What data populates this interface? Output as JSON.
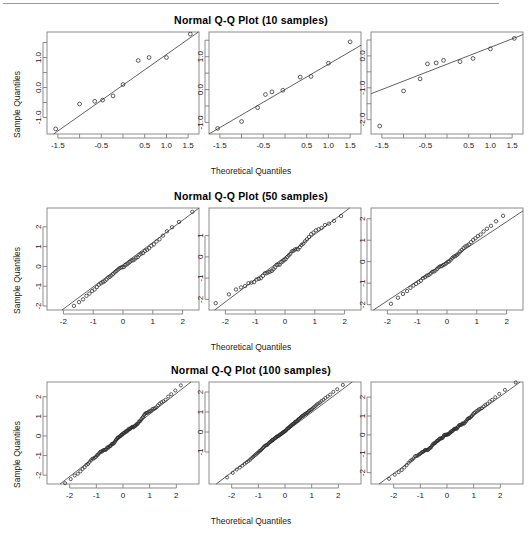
{
  "figure": {
    "axis_label_x": "Theoretical Quantiles",
    "axis_label_y": "Sample Quantiles",
    "rule_color": "#9a9a9a",
    "point_color": "#2b2b2b",
    "line_color": "#3a3a3a",
    "frame_color": "#7f7f7f",
    "background": "#ffffff"
  },
  "rows": [
    {
      "title": "Normal Q-Q Plot (10 samples)",
      "n": 10,
      "xticks": [
        {
          "v": -1.5,
          "label": "-1.5"
        },
        {
          "v": -1.0,
          "label": ""
        },
        {
          "v": -0.5,
          "label": "-0.5"
        },
        {
          "v": 0.0,
          "label": ""
        },
        {
          "v": 0.5,
          "label": "0.5"
        },
        {
          "v": 1.0,
          "label": "1.0"
        },
        {
          "v": 1.5,
          "label": "1.5"
        }
      ],
      "panels": [
        {
          "xlim": [
            -1.75,
            1.75
          ],
          "ylim": [
            -1.55,
            1.85
          ],
          "yticks": [
            {
              "v": -1.0,
              "label": "-1.0"
            },
            {
              "v": -0.5,
              "label": ""
            },
            {
              "v": 0.0,
              "label": "0.0"
            },
            {
              "v": 0.5,
              "label": ""
            },
            {
              "v": 1.0,
              "label": "1.0"
            },
            {
              "v": 1.5,
              "label": ""
            }
          ],
          "qq_line": {
            "slope": 1.02,
            "intercept": 0.08
          },
          "points": [
            {
              "x": -1.55,
              "y": -1.38
            },
            {
              "x": -1.0,
              "y": -0.55
            },
            {
              "x": -0.65,
              "y": -0.46
            },
            {
              "x": -0.47,
              "y": -0.42
            },
            {
              "x": -0.23,
              "y": -0.28
            },
            {
              "x": 0.0,
              "y": 0.1
            },
            {
              "x": 0.35,
              "y": 0.9
            },
            {
              "x": 0.6,
              "y": 1.0
            },
            {
              "x": 1.0,
              "y": 1.0
            },
            {
              "x": 1.55,
              "y": 1.78
            }
          ]
        },
        {
          "xlim": [
            -1.75,
            1.75
          ],
          "ylim": [
            -1.35,
            1.75
          ],
          "yticks": [
            {
              "v": -1.0,
              "label": "-1.0"
            },
            {
              "v": -0.5,
              "label": ""
            },
            {
              "v": 0.0,
              "label": "0.0"
            },
            {
              "v": 0.5,
              "label": ""
            },
            {
              "v": 1.0,
              "label": "1.0"
            },
            {
              "v": 1.5,
              "label": ""
            }
          ],
          "qq_line": {
            "slope": 0.77,
            "intercept": 0.0
          },
          "points": [
            {
              "x": -1.55,
              "y": -1.18
            },
            {
              "x": -1.0,
              "y": -0.97
            },
            {
              "x": -0.63,
              "y": -0.55
            },
            {
              "x": -0.45,
              "y": -0.15
            },
            {
              "x": -0.3,
              "y": -0.07
            },
            {
              "x": -0.05,
              "y": -0.02
            },
            {
              "x": 0.35,
              "y": 0.38
            },
            {
              "x": 0.6,
              "y": 0.4
            },
            {
              "x": 1.0,
              "y": 0.8
            },
            {
              "x": 1.5,
              "y": 1.45
            }
          ]
        },
        {
          "xlim": [
            -1.75,
            1.75
          ],
          "ylim": [
            -2.45,
            0.75
          ],
          "yticks": [
            {
              "v": -2.0,
              "label": "-2.0"
            },
            {
              "v": -1.5,
              "label": ""
            },
            {
              "v": -1.0,
              "label": "-1.0"
            },
            {
              "v": -0.5,
              "label": ""
            },
            {
              "v": 0.0,
              "label": "0.0"
            },
            {
              "v": 0.5,
              "label": ""
            }
          ],
          "qq_line": {
            "slope": 0.53,
            "intercept": -0.26
          },
          "points": [
            {
              "x": -1.55,
              "y": -2.2
            },
            {
              "x": -1.0,
              "y": -1.1
            },
            {
              "x": -0.62,
              "y": -0.72
            },
            {
              "x": -0.45,
              "y": -0.25
            },
            {
              "x": -0.25,
              "y": -0.22
            },
            {
              "x": -0.08,
              "y": -0.14
            },
            {
              "x": 0.3,
              "y": -0.18
            },
            {
              "x": 0.6,
              "y": -0.08
            },
            {
              "x": 1.0,
              "y": 0.22
            },
            {
              "x": 1.55,
              "y": 0.55
            }
          ]
        }
      ]
    },
    {
      "title": "Normal Q-Q Plot (50 samples)",
      "n": 50,
      "xticks": [
        {
          "v": -2.0,
          "label": "-2"
        },
        {
          "v": -1.0,
          "label": "-1"
        },
        {
          "v": 0.0,
          "label": "0"
        },
        {
          "v": 1.0,
          "label": "1"
        },
        {
          "v": 2.0,
          "label": "2"
        }
      ],
      "panels": [
        {
          "xlim": [
            -2.55,
            2.55
          ],
          "ylim": [
            -2.2,
            2.95
          ],
          "yticks": [
            {
              "v": -2.0,
              "label": "-2"
            },
            {
              "v": -1.0,
              "label": "-1"
            },
            {
              "v": 0.0,
              "label": "0"
            },
            {
              "v": 1.0,
              "label": "1"
            },
            {
              "v": 2.0,
              "label": "2"
            }
          ],
          "qq_line": {
            "slope": 1.12,
            "intercept": 0.09
          },
          "seed": 17,
          "tail_lift": 0.3,
          "jitter": 0.075
        },
        {
          "xlim": [
            -2.55,
            2.55
          ],
          "ylim": [
            -2.5,
            2.3
          ],
          "yticks": [
            {
              "v": -2.0,
              "label": "-2"
            },
            {
              "v": -1.0,
              "label": "-1"
            },
            {
              "v": 0.0,
              "label": "0"
            },
            {
              "v": 1.0,
              "label": "1"
            }
          ],
          "qq_line": {
            "slope": 1.06,
            "intercept": 0.0
          },
          "seed": 43,
          "tail_lift": -0.22,
          "jitter": 0.07
        },
        {
          "xlim": [
            -2.55,
            2.55
          ],
          "ylim": [
            -2.25,
            2.5
          ],
          "yticks": [
            {
              "v": -2.0,
              "label": "-2"
            },
            {
              "v": -1.0,
              "label": "-1"
            },
            {
              "v": 0.0,
              "label": "0"
            },
            {
              "v": 1.0,
              "label": "1"
            },
            {
              "v": 2.0,
              "label": "2"
            }
          ],
          "qq_line": {
            "slope": 0.92,
            "intercept": 0.02
          },
          "seed": 91,
          "tail_lift": 0.26,
          "jitter": 0.06
        }
      ]
    },
    {
      "title": "Normal Q-Q Plot (100 samples)",
      "n": 100,
      "xticks": [
        {
          "v": -2.0,
          "label": "-2"
        },
        {
          "v": -1.0,
          "label": "-1"
        },
        {
          "v": 0.0,
          "label": "0"
        },
        {
          "v": 1.0,
          "label": "1"
        },
        {
          "v": 2.0,
          "label": "2"
        }
      ],
      "panels": [
        {
          "xlim": [
            -2.85,
            2.85
          ],
          "ylim": [
            -2.45,
            2.75
          ],
          "yticks": [
            {
              "v": -2.0,
              "label": "-2"
            },
            {
              "v": -1.0,
              "label": "-1"
            },
            {
              "v": 0.0,
              "label": "0"
            },
            {
              "v": 1.0,
              "label": "1"
            },
            {
              "v": 2.0,
              "label": "2"
            }
          ],
          "qq_line": {
            "slope": 1.06,
            "intercept": 0.05
          },
          "seed": 5,
          "tail_lift": 0.22,
          "jitter": 0.05
        },
        {
          "xlim": [
            -2.85,
            2.85
          ],
          "ylim": [
            -2.6,
            2.5
          ],
          "yticks": [
            {
              "v": -1.0,
              "label": "-1"
            },
            {
              "v": 0.0,
              "label": "0"
            },
            {
              "v": 1.0,
              "label": "1"
            },
            {
              "v": 2.0,
              "label": "2"
            }
          ],
          "qq_line": {
            "slope": 1.0,
            "intercept": -0.02
          },
          "seed": 61,
          "tail_lift": 0.1,
          "jitter": 0.05
        },
        {
          "xlim": [
            -2.85,
            2.85
          ],
          "ylim": [
            -2.6,
            2.8
          ],
          "yticks": [
            {
              "v": -2.0,
              "label": "-2"
            },
            {
              "v": -1.0,
              "label": "-1"
            },
            {
              "v": 0.0,
              "label": "0"
            },
            {
              "v": 1.0,
              "label": "1"
            },
            {
              "v": 2.0,
              "label": "2"
            }
          ],
          "qq_line": {
            "slope": 1.02,
            "intercept": 0.0
          },
          "seed": 123,
          "tail_lift": 0.12,
          "jitter": 0.045
        }
      ]
    }
  ]
}
